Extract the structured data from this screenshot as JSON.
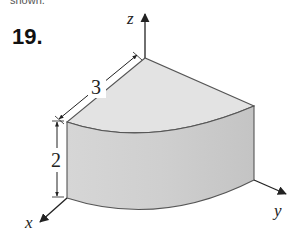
{
  "header": {
    "cropped_text": "shown.",
    "problem_number": "19."
  },
  "figure": {
    "axes": {
      "x": "x",
      "y": "y",
      "z": "z"
    },
    "dimensions": {
      "radius": "3",
      "height": "2"
    },
    "colors": {
      "top_face": "#e2e2e2",
      "front_face": "#cdcdcd",
      "edge": "#555555",
      "axis": "#222222"
    }
  }
}
